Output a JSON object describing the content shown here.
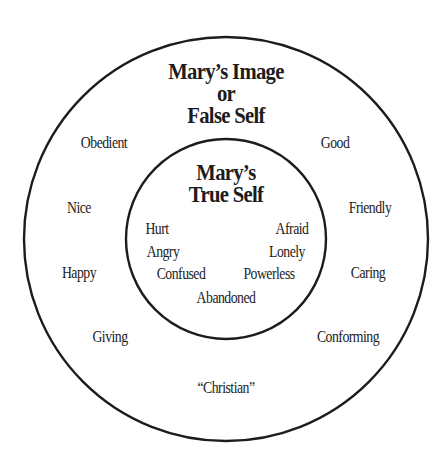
{
  "diagram": {
    "type": "concentric-circles",
    "outer_circle": {
      "title_lines": [
        "Mary’s Image",
        "or",
        "False Self"
      ],
      "traits": [
        {
          "text": "Obedient",
          "x": 104,
          "y": 143
        },
        {
          "text": "Good",
          "x": 335,
          "y": 143
        },
        {
          "text": "Nice",
          "x": 79,
          "y": 208
        },
        {
          "text": "Friendly",
          "x": 370,
          "y": 208
        },
        {
          "text": "Happy",
          "x": 79,
          "y": 273
        },
        {
          "text": "Caring",
          "x": 368,
          "y": 273
        },
        {
          "text": "Giving",
          "x": 110,
          "y": 337
        },
        {
          "text": "Conforming",
          "x": 348,
          "y": 337
        },
        {
          "text": "“Christian”",
          "x": 226,
          "y": 388
        }
      ]
    },
    "inner_circle": {
      "title_lines": [
        "Mary’s",
        "True Self"
      ],
      "feelings": [
        {
          "text": "Hurt",
          "x": 157,
          "y": 229
        },
        {
          "text": "Afraid",
          "x": 292,
          "y": 229
        },
        {
          "text": "Angry",
          "x": 163,
          "y": 252
        },
        {
          "text": "Lonely",
          "x": 287,
          "y": 252
        },
        {
          "text": "Confused",
          "x": 181,
          "y": 274
        },
        {
          "text": "Powerless",
          "x": 269,
          "y": 274
        },
        {
          "text": "Abandoned",
          "x": 226,
          "y": 298
        }
      ]
    },
    "colors": {
      "stroke": "#1c1c1c",
      "background": "#ffffff",
      "text": "#1c1c1c"
    }
  }
}
